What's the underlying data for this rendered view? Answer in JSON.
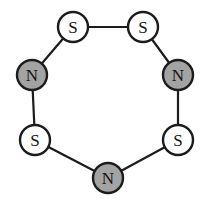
{
  "diagram": {
    "kind": "chemical-ring-structure",
    "background_color": "#ffffff",
    "bond_color": "#1c1c1c",
    "bond_width": 2.2,
    "atom_outline_color": "#1c1c1c",
    "atom_outline_width": 2.4,
    "atom_radius": 15,
    "canvas": {
      "width": 208,
      "height": 202
    },
    "legend": {
      "sulfur_fill": "#ffffff",
      "nitrogen_fill": "#a3a3a3"
    },
    "atoms": [
      {
        "id": "a0",
        "label": "S",
        "element": "sulfur",
        "fill": "#ffffff",
        "x": 73,
        "y": 27,
        "position": "top-left"
      },
      {
        "id": "a1",
        "label": "S",
        "element": "sulfur",
        "fill": "#ffffff",
        "x": 143,
        "y": 27,
        "position": "top-right"
      },
      {
        "id": "a2",
        "label": "N",
        "element": "nitrogen",
        "fill": "#a3a3a3",
        "x": 178,
        "y": 75,
        "position": "right"
      },
      {
        "id": "a3",
        "label": "S",
        "element": "sulfur",
        "fill": "#ffffff",
        "x": 178,
        "y": 140,
        "position": "lower-right"
      },
      {
        "id": "a4",
        "label": "N",
        "element": "nitrogen",
        "fill": "#a3a3a3",
        "x": 108,
        "y": 178,
        "position": "bottom"
      },
      {
        "id": "a5",
        "label": "S",
        "element": "sulfur",
        "fill": "#ffffff",
        "x": 35,
        "y": 140,
        "position": "lower-left"
      },
      {
        "id": "a6",
        "label": "N",
        "element": "nitrogen",
        "fill": "#a3a3a3",
        "x": 32,
        "y": 75,
        "position": "left"
      }
    ],
    "bonds": [
      {
        "id": "b0",
        "from": "a0",
        "to": "a1",
        "order": 1
      },
      {
        "id": "b1",
        "from": "a1",
        "to": "a2",
        "order": 1
      },
      {
        "id": "b2",
        "from": "a2",
        "to": "a3",
        "order": 1
      },
      {
        "id": "b3",
        "from": "a3",
        "to": "a4",
        "order": 1
      },
      {
        "id": "b4",
        "from": "a4",
        "to": "a5",
        "order": 1
      },
      {
        "id": "b5",
        "from": "a5",
        "to": "a6",
        "order": 1
      },
      {
        "id": "b6",
        "from": "a6",
        "to": "a0",
        "order": 1
      }
    ]
  }
}
